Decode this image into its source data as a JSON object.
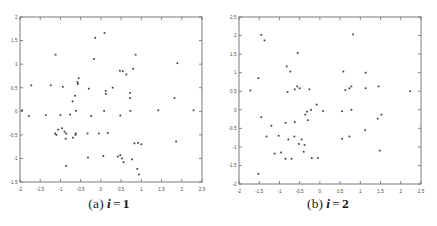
{
  "figure": {
    "background_color": "#ffffff",
    "axis_color": "#6b6b6b",
    "point_color": "#3a3a3a",
    "tick_label_color": "#4a4a4a"
  },
  "panels": [
    {
      "id": "panel-a",
      "caption_index": "(a)",
      "caption_variable": "i",
      "caption_equals": "=",
      "caption_value": "1"
    },
    {
      "id": "panel-b",
      "caption_index": "(b)",
      "caption_variable": "i",
      "caption_equals": "=",
      "caption_value": "2"
    }
  ],
  "chart_data": [
    {
      "type": "scatter",
      "title": "(a) i = 1",
      "xlabel": "",
      "ylabel": "",
      "xlim": [
        -2,
        2.5
      ],
      "ylim": [
        -1.5,
        2
      ],
      "xticks": [
        -2,
        -1.5,
        -1,
        -0.5,
        0,
        0.5,
        1,
        1.5,
        2,
        2.5
      ],
      "xticklabels": [
        "-2",
        "-1.5",
        "-1",
        "-0.5",
        "0",
        "0.5",
        "1",
        "1.5",
        "2",
        "2.5"
      ],
      "yticks": [
        -1.5,
        -1,
        -0.5,
        0,
        0.5,
        1,
        1.5,
        2
      ],
      "yticklabels": [
        "-1.5",
        "-1",
        "-0.5",
        "0",
        "0.5",
        "1",
        "1.5",
        "2"
      ],
      "grid": false,
      "legend": null,
      "marker": "square",
      "points": [
        [
          -0.14,
          1.56
        ],
        [
          0.09,
          1.66
        ],
        [
          -1.12,
          1.2
        ],
        [
          0.86,
          1.2
        ],
        [
          -0.17,
          1.11
        ],
        [
          1.89,
          1.02
        ],
        [
          0.47,
          0.86
        ],
        [
          0.54,
          0.85
        ],
        [
          0.8,
          0.9
        ],
        [
          0.63,
          0.78
        ],
        [
          -0.55,
          0.7
        ],
        [
          -0.58,
          0.62
        ],
        [
          -0.57,
          0.58
        ],
        [
          -1.72,
          0.55
        ],
        [
          -1.24,
          0.55
        ],
        [
          -0.94,
          0.52
        ],
        [
          -0.3,
          0.48
        ],
        [
          0.29,
          0.5
        ],
        [
          0.12,
          0.43
        ],
        [
          0.12,
          0.37
        ],
        [
          0.72,
          0.39
        ],
        [
          -0.64,
          0.33
        ],
        [
          0.72,
          0.28
        ],
        [
          1.82,
          0.28
        ],
        [
          -0.7,
          0.21
        ],
        [
          -1.95,
          0.02
        ],
        [
          2.29,
          0.02
        ],
        [
          1.42,
          0.02
        ],
        [
          0.08,
          0.01
        ],
        [
          0.73,
          0.01
        ],
        [
          -0.62,
          0.01
        ],
        [
          -1.78,
          -0.1
        ],
        [
          -1.36,
          -0.08
        ],
        [
          -1.0,
          -0.08
        ],
        [
          -0.76,
          -0.07
        ],
        [
          0.48,
          -0.09
        ],
        [
          -0.24,
          -0.1
        ],
        [
          -1.06,
          -0.39
        ],
        [
          -0.96,
          -0.36
        ],
        [
          -1.13,
          -0.47
        ],
        [
          -1.1,
          -0.5
        ],
        [
          -0.9,
          -0.43
        ],
        [
          -0.86,
          -0.47
        ],
        [
          -0.63,
          -0.5
        ],
        [
          -0.62,
          -0.47
        ],
        [
          -0.69,
          -0.56
        ],
        [
          -0.33,
          -0.47
        ],
        [
          -0.05,
          -0.47
        ],
        [
          0.17,
          -0.46
        ],
        [
          -0.87,
          -0.58
        ],
        [
          0.83,
          -0.68
        ],
        [
          0.92,
          -0.67
        ],
        [
          1.0,
          -0.7
        ],
        [
          1.86,
          -0.64
        ],
        [
          -0.32,
          -0.98
        ],
        [
          0.06,
          -0.95
        ],
        [
          0.42,
          -0.96
        ],
        [
          0.48,
          -0.93
        ],
        [
          0.52,
          -1.0
        ],
        [
          0.77,
          -1.02
        ],
        [
          0.56,
          -1.08
        ],
        [
          -0.86,
          -1.16
        ],
        [
          0.9,
          -1.22
        ],
        [
          0.94,
          -1.34
        ]
      ]
    },
    {
      "type": "scatter",
      "title": "(b) i = 2",
      "xlabel": "",
      "ylabel": "",
      "xlim": [
        -2,
        2.5
      ],
      "ylim": [
        -2,
        2.5
      ],
      "xticks": [
        -2,
        -1.5,
        -1,
        -0.5,
        0,
        0.5,
        1,
        1.5,
        2,
        2.5
      ],
      "xticklabels": [
        "-2",
        "-1.5",
        "-1",
        "-0.5",
        "0",
        "0.5",
        "1",
        "1.5",
        "2",
        "2.5"
      ],
      "yticks": [
        -2,
        -1.5,
        -1,
        -0.5,
        0,
        0.5,
        1,
        1.5,
        2,
        2.5
      ],
      "yticklabels": [
        "-2",
        "-1.5",
        "-1",
        "-0.5",
        "0",
        "0.5",
        "1",
        "1.5",
        "2",
        "2.5"
      ],
      "grid": false,
      "legend": null,
      "marker": "square",
      "points": [
        [
          -1.45,
          2.02
        ],
        [
          0.82,
          2.03
        ],
        [
          -1.37,
          1.87
        ],
        [
          -0.55,
          1.53
        ],
        [
          -0.82,
          1.17
        ],
        [
          -0.73,
          1.03
        ],
        [
          0.58,
          1.03
        ],
        [
          1.13,
          1.0
        ],
        [
          -1.52,
          0.85
        ],
        [
          -1.72,
          0.52
        ],
        [
          -0.8,
          0.48
        ],
        [
          -0.62,
          0.55
        ],
        [
          -0.56,
          0.63
        ],
        [
          -0.5,
          0.58
        ],
        [
          -0.26,
          0.55
        ],
        [
          0.63,
          0.53
        ],
        [
          0.73,
          0.58
        ],
        [
          0.78,
          0.63
        ],
        [
          1.13,
          0.58
        ],
        [
          1.45,
          0.63
        ],
        [
          2.23,
          0.5
        ],
        [
          -0.08,
          0.14
        ],
        [
          -1.45,
          -0.2
        ],
        [
          -0.22,
          0.0
        ],
        [
          -0.32,
          -0.05
        ],
        [
          0.08,
          -0.03
        ],
        [
          0.78,
          0.0
        ],
        [
          -0.36,
          -0.13
        ],
        [
          0.55,
          -0.04
        ],
        [
          1.52,
          -0.13
        ],
        [
          -1.2,
          -0.43
        ],
        [
          1.43,
          -0.24
        ],
        [
          -0.85,
          -0.35
        ],
        [
          -0.62,
          -0.33
        ],
        [
          -0.3,
          -0.28
        ],
        [
          1.12,
          -0.55
        ],
        [
          -1.32,
          -0.72
        ],
        [
          -1.02,
          -0.7
        ],
        [
          -0.63,
          -0.72
        ],
        [
          -0.78,
          -0.8
        ],
        [
          -0.45,
          -0.8
        ],
        [
          0.73,
          -0.72
        ],
        [
          -0.52,
          -0.92
        ],
        [
          -0.38,
          -0.95
        ],
        [
          0.55,
          -0.78
        ],
        [
          -1.12,
          -1.18
        ],
        [
          -0.96,
          -1.15
        ],
        [
          1.48,
          -1.1
        ],
        [
          -0.4,
          -1.13
        ],
        [
          -0.85,
          -1.32
        ],
        [
          -0.7,
          -1.32
        ],
        [
          -0.2,
          -1.3
        ],
        [
          -0.05,
          -1.3
        ],
        [
          -1.52,
          -1.73
        ]
      ]
    }
  ]
}
